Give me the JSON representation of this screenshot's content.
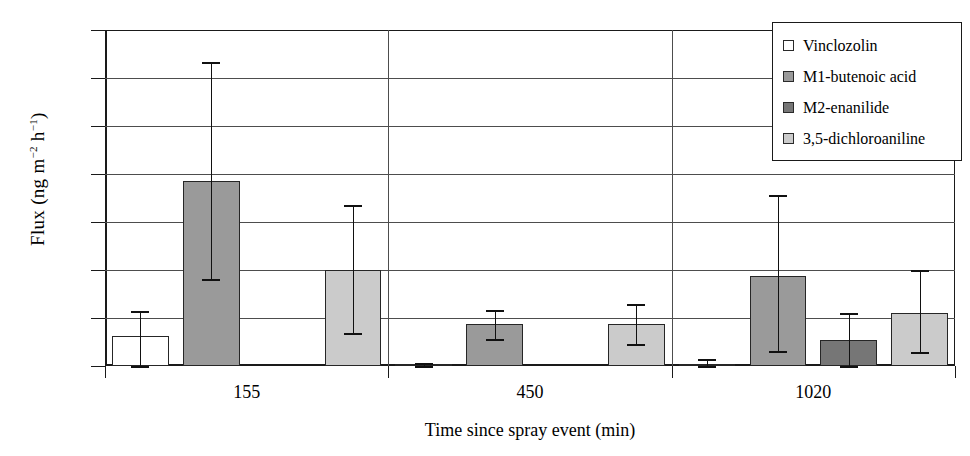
{
  "chart_data": {
    "type": "bar",
    "title": "",
    "xlabel": "Time since spray event (min)",
    "ylabel": "Flux (ng m-2 h-1)",
    "ylabel_parts": {
      "prefix": "Flux (ng m",
      "sup1": "−2",
      "mid": " h",
      "sup2": "−1",
      "suffix": ")"
    },
    "categories": [
      "155",
      "450",
      "1020"
    ],
    "ylim": [
      0,
      350
    ],
    "yticks": [
      0,
      50,
      100,
      150,
      200,
      250,
      300,
      350
    ],
    "ytick_labels": [
      "0",
      "50",
      "100",
      "150",
      "200",
      "250",
      "300",
      "350"
    ],
    "grid": true,
    "legend_position": "top-right",
    "series": [
      {
        "name": "Vinclozolin",
        "fill": "white",
        "color": "#ffffff",
        "values": [
          31,
          2,
          2
        ],
        "err_low": [
          31,
          2,
          2
        ],
        "err_high": [
          26,
          1,
          5
        ]
      },
      {
        "name": "M1-butenoic acid",
        "fill": "mid-gray",
        "color": "#9a9a9a",
        "values": [
          193,
          44,
          94
        ],
        "err_low": [
          102,
          16,
          78
        ],
        "err_high": [
          124,
          14,
          84
        ]
      },
      {
        "name": "M2-enanilide",
        "fill": "dark-gray",
        "color": "#767676",
        "values": [
          null,
          null,
          27
        ],
        "err_low": [
          null,
          null,
          27
        ],
        "err_high": [
          null,
          null,
          28
        ]
      },
      {
        "name": "3,5-dichloroaniline",
        "fill": "light-gray",
        "color": "#cbcbcb",
        "values": [
          100,
          44,
          55
        ],
        "err_low": [
          66,
          21,
          40
        ],
        "err_high": [
          68,
          21,
          45
        ]
      }
    ]
  },
  "legend": {
    "items": [
      {
        "label": "Vinclozolin",
        "color": "#ffffff"
      },
      {
        "label": "M1-butenoic acid",
        "color": "#9a9a9a"
      },
      {
        "label": "M2-enanilide",
        "color": "#767676"
      },
      {
        "label": "3,5-dichloroaniline",
        "color": "#cbcbcb"
      }
    ]
  }
}
